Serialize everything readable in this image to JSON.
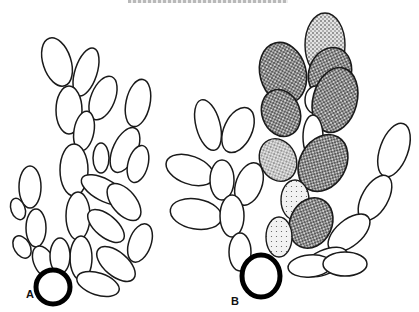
{
  "header": {
    "running_title": ""
  },
  "figure": {
    "panels": [
      {
        "id": "A",
        "label": "A",
        "description": "Unshaded branched chain of ovoid cells arising from a thick-walled basal cell"
      },
      {
        "id": "B",
        "label": "B",
        "description": "Branched chain with stippled (pigmented) ovoid cells on central branch arising from thick-walled basal cell"
      }
    ]
  },
  "colors": {
    "ink": "#1a1a1a",
    "paper": "#ffffff",
    "stipple": "#3a3a3a"
  }
}
